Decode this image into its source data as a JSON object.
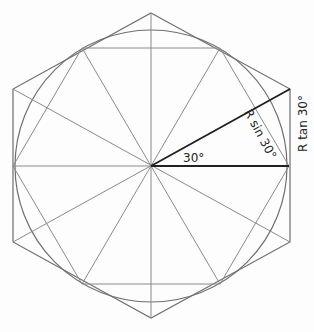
{
  "diagram": {
    "title": "",
    "labels": {
      "angle": "30°",
      "r_sin": "R sin 30°",
      "r_tan": "R tan 30°"
    },
    "geometry": {
      "center": [
        151,
        166
      ],
      "circle_radius": 136,
      "outer_hexagon": [
        [
          151,
          13
        ],
        [
          290,
          89
        ],
        [
          290,
          242
        ],
        [
          151,
          318
        ],
        [
          13,
          242
        ],
        [
          13,
          89
        ]
      ],
      "inner_hexagon": [
        [
          289,
          166
        ],
        [
          220,
          48
        ],
        [
          82,
          48
        ],
        [
          13,
          166
        ],
        [
          82,
          284
        ],
        [
          220,
          284
        ]
      ]
    },
    "colors": {
      "line": "#8a8a8a",
      "emphasis": "#222222",
      "background": "#fdfdfd"
    }
  }
}
